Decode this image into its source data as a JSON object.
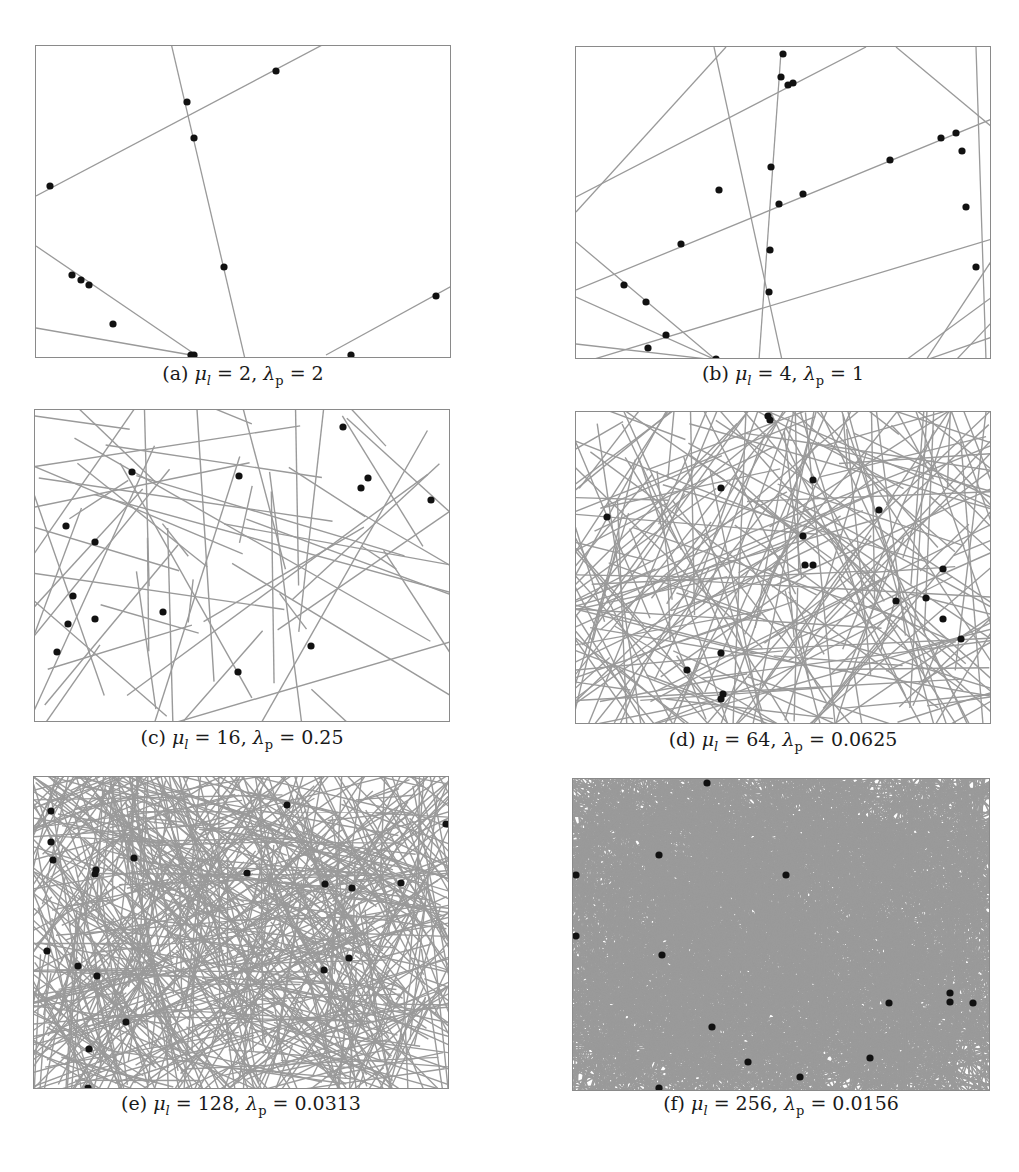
{
  "figure": {
    "line_color": "#9a9a9a",
    "point_color": "#111111",
    "frame_color": "#8a8a8a",
    "panels": [
      {
        "id": "a",
        "label": "(a)",
        "mu_symbol": "μ",
        "mu_sub": "l",
        "mu_value": "2",
        "lambda_symbol": "λ",
        "lambda_sub": "p",
        "lambda_value": "2",
        "caption_eq1": " = ",
        "caption_sep": ", ",
        "caption_eq2": " = ",
        "frame": {
          "x": 35,
          "y": 45,
          "w": 416,
          "h": 313
        },
        "caption_pos": {
          "x": 35,
          "y": 362,
          "w": 416
        },
        "lines": [
          [
            0,
            150,
            290,
            -3
          ],
          [
            135,
            -3,
            209,
            313
          ],
          [
            0,
            200,
            160,
            309
          ],
          [
            0,
            282,
            155,
            309
          ],
          [
            290,
            309,
            416,
            240
          ]
        ],
        "points": [
          [
            240,
            25
          ],
          [
            151,
            56
          ],
          [
            158,
            92
          ],
          [
            14,
            140
          ],
          [
            188,
            221
          ],
          [
            36,
            229
          ],
          [
            45,
            234
          ],
          [
            53,
            239
          ],
          [
            77,
            278
          ],
          [
            155,
            309
          ],
          [
            158,
            309
          ],
          [
            315,
            309
          ],
          [
            400,
            250
          ]
        ],
        "line_count": 0,
        "seed": 0
      },
      {
        "id": "b",
        "label": "(b)",
        "mu_symbol": "μ",
        "mu_sub": "l",
        "mu_value": "4",
        "lambda_symbol": "λ",
        "lambda_sub": "p",
        "lambda_value": "1",
        "caption_eq1": " = ",
        "caption_sep": ", ",
        "caption_eq2": " = ",
        "frame": {
          "x": 575,
          "y": 46,
          "w": 416,
          "h": 313
        },
        "caption_pos": {
          "x": 575,
          "y": 362,
          "w": 416
        },
        "lines": [
          [
            0,
            165,
            150,
            0
          ],
          [
            0,
            150,
            290,
            0
          ],
          [
            138,
            0,
            206,
            313
          ],
          [
            205,
            5,
            183,
            313
          ],
          [
            320,
            0,
            416,
            80
          ],
          [
            0,
            243,
            416,
            72
          ],
          [
            0,
            195,
            140,
            313
          ],
          [
            0,
            250,
            140,
            313
          ],
          [
            0,
            297,
            140,
            313
          ],
          [
            15,
            313,
            416,
            192
          ],
          [
            380,
            313,
            416,
            275
          ],
          [
            400,
            0,
            410,
            313
          ],
          [
            330,
            313,
            416,
            250
          ],
          [
            350,
            313,
            416,
            290
          ],
          [
            350,
            313,
            416,
            213
          ]
        ],
        "points": [
          [
            207,
            7
          ],
          [
            205,
            30
          ],
          [
            212,
            38
          ],
          [
            217,
            36
          ],
          [
            195,
            120
          ],
          [
            143,
            143
          ],
          [
            314,
            113
          ],
          [
            365,
            91
          ],
          [
            380,
            86
          ],
          [
            386,
            104
          ],
          [
            390,
            160
          ],
          [
            400,
            220
          ],
          [
            227,
            147
          ],
          [
            203,
            157
          ],
          [
            105,
            197
          ],
          [
            194,
            203
          ],
          [
            48,
            238
          ],
          [
            70,
            255
          ],
          [
            90,
            288
          ],
          [
            72,
            301
          ],
          [
            140,
            312
          ],
          [
            193,
            245
          ]
        ],
        "line_count": 0,
        "seed": 0
      },
      {
        "id": "c",
        "label": "(c)",
        "mu_symbol": "μ",
        "mu_sub": "l",
        "mu_value": "16",
        "lambda_symbol": "λ",
        "lambda_sub": "p",
        "lambda_value": "0.25",
        "caption_eq1": " = ",
        "caption_sep": ", ",
        "caption_eq2": " = ",
        "frame": {
          "x": 34,
          "y": 409,
          "w": 416,
          "h": 313
        },
        "caption_pos": {
          "x": 34,
          "y": 726,
          "w": 416
        },
        "lines": [],
        "points": [
          [
            97,
            62
          ],
          [
            204,
            66
          ],
          [
            308,
            17
          ],
          [
            326,
            78
          ],
          [
            333,
            68
          ],
          [
            396,
            90
          ],
          [
            31,
            116
          ],
          [
            60,
            132
          ],
          [
            38,
            186
          ],
          [
            128,
            202
          ],
          [
            33,
            214
          ],
          [
            60,
            209
          ],
          [
            22,
            242
          ],
          [
            203,
            262
          ],
          [
            276,
            236
          ],
          [
            262,
            331
          ],
          [
            332,
            340
          ],
          [
            215,
            318
          ]
        ],
        "line_count": 60,
        "seed": 16
      },
      {
        "id": "d",
        "label": "(d)",
        "mu_symbol": "μ",
        "mu_sub": "l",
        "mu_value": "64",
        "lambda_symbol": "λ",
        "lambda_sub": "p",
        "lambda_value": "0.0625",
        "caption_eq1": " = ",
        "caption_sep": ", ",
        "caption_eq2": " = ",
        "frame": {
          "x": 575,
          "y": 411,
          "w": 416,
          "h": 313
        },
        "caption_pos": {
          "x": 575,
          "y": 728,
          "w": 416
        },
        "lines": [],
        "points": [
          [
            192,
            4
          ],
          [
            194,
            8
          ],
          [
            237,
            68
          ],
          [
            145,
            76
          ],
          [
            31,
            105
          ],
          [
            303,
            98
          ],
          [
            227,
            124
          ],
          [
            229,
            153
          ],
          [
            237,
            153
          ],
          [
            367,
            157
          ],
          [
            320,
            189
          ],
          [
            350,
            186
          ],
          [
            367,
            207
          ],
          [
            385,
            227
          ],
          [
            145,
            241
          ],
          [
            111,
            258
          ],
          [
            147,
            282
          ],
          [
            145,
            287
          ]
        ],
        "line_count": 240,
        "seed": 64
      },
      {
        "id": "e",
        "label": "(e)",
        "mu_symbol": "μ",
        "mu_sub": "l",
        "mu_value": "128",
        "lambda_symbol": "λ",
        "lambda_sub": "p",
        "lambda_value": "0.0313",
        "caption_eq1": " = ",
        "caption_sep": ", ",
        "caption_eq2": " = ",
        "frame": {
          "x": 33,
          "y": 776,
          "w": 416,
          "h": 313
        },
        "caption_pos": {
          "x": 33,
          "y": 1092,
          "w": 416
        },
        "lines": [],
        "points": [
          [
            17,
            34
          ],
          [
            17,
            65
          ],
          [
            19,
            83
          ],
          [
            62,
            93
          ],
          [
            61,
            97
          ],
          [
            100,
            81
          ],
          [
            253,
            28
          ],
          [
            213,
            96
          ],
          [
            291,
            107
          ],
          [
            318,
            111
          ],
          [
            367,
            106
          ],
          [
            412,
            47
          ],
          [
            13,
            174
          ],
          [
            44,
            189
          ],
          [
            63,
            199
          ],
          [
            290,
            193
          ],
          [
            315,
            181
          ],
          [
            92,
            245
          ],
          [
            55,
            272
          ],
          [
            54,
            311
          ]
        ],
        "line_count": 700,
        "seed": 128
      },
      {
        "id": "f",
        "label": "(f)",
        "mu_symbol": "μ",
        "mu_sub": "l",
        "mu_value": "256",
        "lambda_symbol": "λ",
        "lambda_sub": "p",
        "lambda_value": "0.0156",
        "caption_eq1": " = ",
        "caption_sep": ", ",
        "caption_eq2": " = ",
        "frame": {
          "x": 572,
          "y": 778,
          "w": 418,
          "h": 313
        },
        "caption_pos": {
          "x": 572,
          "y": 1092,
          "w": 418
        },
        "lines": [],
        "points": [
          [
            134,
            4
          ],
          [
            86,
            76
          ],
          [
            3,
            96
          ],
          [
            213,
            96
          ],
          [
            3,
            157
          ],
          [
            89,
            176
          ],
          [
            423,
            166
          ],
          [
            316,
            224
          ],
          [
            377,
            214
          ],
          [
            377,
            223
          ],
          [
            400,
            224
          ],
          [
            139,
            248
          ],
          [
            175,
            283
          ],
          [
            297,
            279
          ],
          [
            227,
            298
          ],
          [
            86,
            309
          ]
        ],
        "line_count": 2600,
        "seed": 256
      }
    ]
  }
}
